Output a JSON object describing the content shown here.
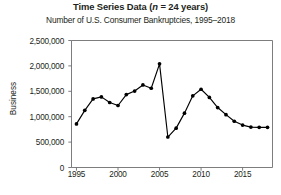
{
  "chart_data": {
    "type": "line",
    "title": "Time Series Data (n = 24 years)",
    "title_prefix": "Time Series Data (",
    "title_n": "n",
    "title_suffix": " = 24 years)",
    "subtitle": "Number of U.S. Consumer Bankruptcies, 1995–2018",
    "xlabel": "",
    "ylabel": "Business",
    "ylim": [
      0,
      2500000
    ],
    "xlim": [
      1994.4,
      2018.6
    ],
    "grid": false,
    "legend": "none",
    "marker": "filled-circle",
    "line_color": "#000000",
    "frame_color": "#6e6e70",
    "ytick_values": [
      0,
      500000,
      1000000,
      1500000,
      2000000,
      2500000
    ],
    "ytick_labels": [
      "0",
      "500,000",
      "1,000,000",
      "1,500,000",
      "2,000,000",
      "2,500,000"
    ],
    "xtick_values": [
      1995,
      2000,
      2005,
      2010,
      2015
    ],
    "xtick_labels": [
      "1995",
      "2000",
      "2005",
      "2010",
      "2015"
    ],
    "x": [
      1995,
      1996,
      1997,
      1998,
      1999,
      2000,
      2001,
      2002,
      2003,
      2004,
      2005,
      2006,
      2007,
      2008,
      2009,
      2010,
      2011,
      2012,
      2013,
      2014,
      2015,
      2016,
      2017,
      2018
    ],
    "values": [
      858000,
      1125000,
      1350000,
      1390000,
      1280000,
      1220000,
      1435000,
      1505000,
      1625000,
      1560000,
      2040000,
      600000,
      775000,
      1070000,
      1410000,
      1540000,
      1380000,
      1180000,
      1040000,
      910000,
      835000,
      795000,
      790000,
      790000
    ],
    "series": [
      {
        "name": "U.S. Consumer Bankruptcies",
        "values": [
          858000,
          1125000,
          1350000,
          1390000,
          1280000,
          1220000,
          1435000,
          1505000,
          1625000,
          1560000,
          2040000,
          600000,
          775000,
          1070000,
          1410000,
          1540000,
          1380000,
          1180000,
          1040000,
          910000,
          835000,
          795000,
          790000,
          790000
        ]
      }
    ]
  }
}
